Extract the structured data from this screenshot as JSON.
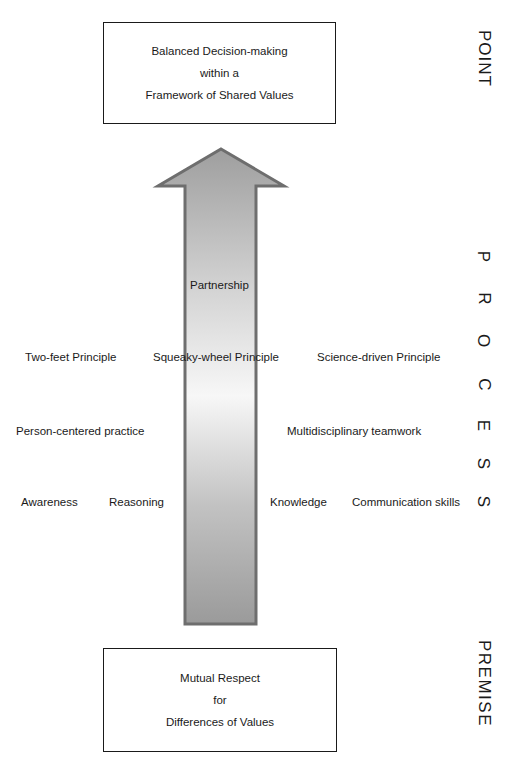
{
  "point_box": {
    "lines": [
      "Balanced Decision-making",
      "within a",
      "Framework of Shared Values"
    ]
  },
  "premise_box": {
    "lines": [
      "Mutual Respect",
      "for",
      "Differences of Values"
    ]
  },
  "arrow": {
    "label": "Partnership",
    "direction": "up",
    "colors": {
      "top": "#9e9e9e",
      "middle": "#f7f7f7",
      "bottom": "#9a9a9a",
      "border": "#6e6e6e"
    }
  },
  "process_labels": {
    "principles": [
      "Two-feet Principle",
      "Squeaky-wheel Principle",
      "Science-driven Principle"
    ],
    "practices": [
      "Person-centered practice",
      "Multidisciplinary teamwork"
    ],
    "skills": [
      "Awareness",
      "Reasoning",
      "Knowledge",
      "Communication skills"
    ]
  },
  "side_labels": {
    "point": "POINT",
    "process": [
      "P",
      "R",
      "O",
      "C",
      "E",
      "S",
      "S"
    ],
    "premise": "PREMISE"
  }
}
